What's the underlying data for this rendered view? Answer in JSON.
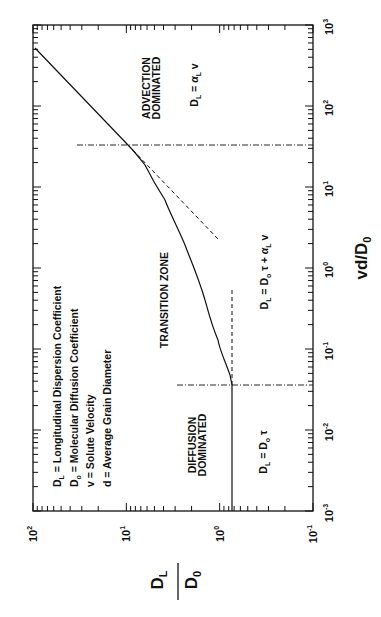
{
  "chart_data": {
    "type": "line",
    "orientation": "figure rotated 90 degrees counter-clockwise",
    "title": "",
    "xlabel": "vd/D0",
    "ylabel": "DL/D0",
    "xscale": "log",
    "yscale": "log",
    "xlim": [
      0.001,
      1000
    ],
    "ylim": [
      0.1,
      100
    ],
    "x_ticks": [
      "10^-3",
      "10^-2",
      "10^-1",
      "10^0",
      "10^1",
      "10^2",
      "10^3"
    ],
    "y_ticks": [
      "10^-1",
      "10^0",
      "10^1",
      "10^2"
    ],
    "grid": false,
    "series": [
      {
        "name": "DL/D0 curve",
        "style": "solid",
        "x": [
          0.001,
          0.01,
          0.036,
          0.048,
          0.129,
          0.403,
          1.92,
          6.92,
          18.7,
          33.0,
          520
        ],
        "y": [
          0.74,
          0.74,
          0.74,
          0.77,
          1.04,
          1.44,
          2.35,
          3.86,
          6.3,
          9.6,
          95
        ]
      },
      {
        "name": "Advection asymptote",
        "style": "dashed",
        "x": [
          33.0,
          5.0
        ],
        "y": [
          9.6,
          2.05
        ]
      },
      {
        "name": "Diffusion asymptote",
        "style": "dashed",
        "x": [
          0.036,
          0.5
        ],
        "y": [
          0.74,
          0.74
        ]
      }
    ],
    "reference_lines": [
      {
        "axis": "x",
        "value": 0.036,
        "style": "dash-dot",
        "y_range": [
          0.1,
          1.1
        ]
      },
      {
        "axis": "x",
        "value": 33.0,
        "style": "dash-dot",
        "y_range": [
          0.1,
          30
        ]
      }
    ],
    "annotations": [
      {
        "text": "ADVECTION DOMINATED",
        "x": 200,
        "y": 30
      },
      {
        "text": "DL = αL v",
        "x": 200,
        "y": 3.5
      },
      {
        "text": "TRANSITION ZONE",
        "x": 0.3,
        "y": 5.5
      },
      {
        "text": "DL = D0 τ + αL v",
        "x": 0.3,
        "y": 0.25
      },
      {
        "text": "DIFFUSION DOMINATED",
        "x": 0.005,
        "y": 3.0
      },
      {
        "text": "DL = D0 τ",
        "x": 0.004,
        "y": 0.25
      }
    ],
    "legend": [
      "DL = Longitudinal Dispersion Coefficient",
      "D0 = Molecular Diffusion Coefficient",
      "v = Solute Velocity",
      "d = Average Grain Diameter"
    ]
  },
  "axes": {
    "x_title": {
      "main": "vd/D",
      "sub": "0"
    },
    "y_title": {
      "num": "D",
      "num_sub": "L",
      "den": "D",
      "den_sub": "0"
    },
    "x_tick_labels": [
      {
        "base": "10",
        "exp": "-3"
      },
      {
        "base": "10",
        "exp": "-2"
      },
      {
        "base": "10",
        "exp": "-1"
      },
      {
        "base": "10",
        "exp": "0"
      },
      {
        "base": "10",
        "exp": "1"
      },
      {
        "base": "10",
        "exp": "2"
      },
      {
        "base": "10",
        "exp": "3"
      }
    ],
    "y_tick_labels": [
      {
        "base": "10",
        "exp": "-1"
      },
      {
        "base": "10",
        "exp": "0"
      },
      {
        "base": "10",
        "exp": "1"
      },
      {
        "base": "10",
        "exp": "2"
      }
    ]
  },
  "legend": {
    "items": [
      {
        "sym": "D",
        "sub": "L",
        "text": " = Longitudinal Dispersion Coefficient"
      },
      {
        "sym": "D",
        "sub": "o",
        "text": " = Molecular Diffusion Coefficient"
      },
      {
        "sym": "v",
        "sub": "",
        "text": " = Solute Velocity"
      },
      {
        "sym": "d",
        "sub": "",
        "text": " = Average Grain Diameter"
      }
    ]
  },
  "regions": {
    "advection": {
      "line1": "ADVECTION",
      "line2": "DOMINATED"
    },
    "transition": {
      "line1": "TRANSITION ZONE"
    },
    "diffusion": {
      "line1": "DIFFUSION",
      "line2": "DOMINATED"
    }
  },
  "equations": {
    "advection": {
      "a": "D",
      "a_sub": "L",
      "b": " = ",
      "c": "α",
      "c_sub": "L",
      "d": " v"
    },
    "transition": {
      "a": "D",
      "a_sub": "L",
      "b": " = D",
      "b_sub": "o",
      "c": " τ + ",
      "d": "α",
      "d_sub": "L",
      "e": " v"
    },
    "diffusion": {
      "a": "D",
      "a_sub": "L",
      "b": " = D",
      "b_sub": "o",
      "c": " τ"
    }
  }
}
